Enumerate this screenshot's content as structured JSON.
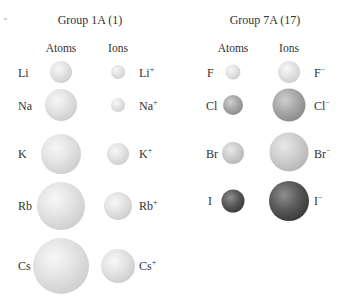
{
  "groups": [
    {
      "title": "Group 1A (1)",
      "atoms_header": "Atoms",
      "ions_header": "Ions",
      "rows": [
        {
          "element": "Li",
          "ion": "Li",
          "charge": "+"
        },
        {
          "element": "Na",
          "ion": "Na",
          "charge": "+"
        },
        {
          "element": "K",
          "ion": "K",
          "charge": "+"
        },
        {
          "element": "Rb",
          "ion": "Rb",
          "charge": "+"
        },
        {
          "element": "Cs",
          "ion": "Cs",
          "charge": "+"
        }
      ]
    },
    {
      "title": "Group 7A (17)",
      "atoms_header": "Atoms",
      "ions_header": "Ions",
      "rows": [
        {
          "element": "F",
          "ion": "F",
          "charge": "−"
        },
        {
          "element": "Cl",
          "ion": "Cl",
          "charge": "−"
        },
        {
          "element": "Br",
          "ion": "Br",
          "charge": "−"
        },
        {
          "element": "I",
          "ion": "I",
          "charge": "−"
        }
      ]
    }
  ],
  "colors": {
    "alkali_spheres": "#e0e0e0",
    "fluorine": "#e0e0e0",
    "chlorine": "#9a9a9a",
    "bromine": "#c8c8c8",
    "iodine": "#4a4a4a"
  }
}
